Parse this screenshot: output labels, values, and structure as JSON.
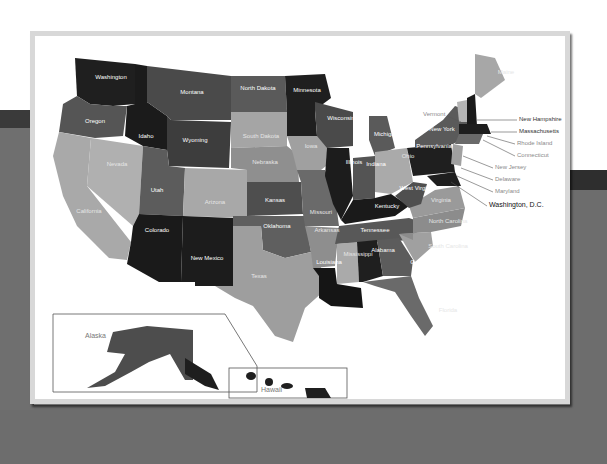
{
  "scene": {
    "description": "Photograph of a printed grayscale United States map poster with state names",
    "colors": {
      "poster_frame": "#d8d8d8",
      "background_bottom": "#6d6d6d",
      "state_dark": "#1e1e1e",
      "state_mid": "#5a5a5a",
      "state_light": "#a8a8a8"
    }
  },
  "map": {
    "states": [
      {
        "name": "Washington"
      },
      {
        "name": "Oregon"
      },
      {
        "name": "California"
      },
      {
        "name": "Nevada"
      },
      {
        "name": "Idaho"
      },
      {
        "name": "Montana"
      },
      {
        "name": "Wyoming"
      },
      {
        "name": "Utah"
      },
      {
        "name": "Arizona"
      },
      {
        "name": "Colorado"
      },
      {
        "name": "New Mexico"
      },
      {
        "name": "North Dakota"
      },
      {
        "name": "South Dakota"
      },
      {
        "name": "Nebraska"
      },
      {
        "name": "Kansas"
      },
      {
        "name": "Oklahoma"
      },
      {
        "name": "Texas"
      },
      {
        "name": "Minnesota"
      },
      {
        "name": "Iowa"
      },
      {
        "name": "Missouri"
      },
      {
        "name": "Arkansas"
      },
      {
        "name": "Louisiana"
      },
      {
        "name": "Wisconsin"
      },
      {
        "name": "Illinois"
      },
      {
        "name": "Michigan"
      },
      {
        "name": "Indiana"
      },
      {
        "name": "Ohio"
      },
      {
        "name": "Kentucky"
      },
      {
        "name": "Tennessee"
      },
      {
        "name": "Mississippi"
      },
      {
        "name": "Alabama"
      },
      {
        "name": "Georgia"
      },
      {
        "name": "Florida"
      },
      {
        "name": "South Carolina"
      },
      {
        "name": "North Carolina"
      },
      {
        "name": "Virginia"
      },
      {
        "name": "West Virginia"
      },
      {
        "name": "Pennsylvania"
      },
      {
        "name": "New York"
      },
      {
        "name": "Maine"
      }
    ],
    "callouts": [
      {
        "name": "Vermont"
      },
      {
        "name": "New Hampshire"
      },
      {
        "name": "Massachusetts"
      },
      {
        "name": "Rhode Island"
      },
      {
        "name": "Connecticut"
      },
      {
        "name": "New Jersey"
      },
      {
        "name": "Delaware"
      },
      {
        "name": "Maryland"
      },
      {
        "name": "Washington, D.C."
      }
    ],
    "insets": {
      "alaska": "Alaska",
      "hawaii": "Hawaii"
    }
  }
}
